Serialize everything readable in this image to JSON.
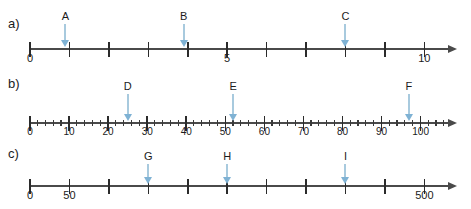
{
  "header": {
    "cut_text": ""
  },
  "lines": [
    {
      "id": "a",
      "label": "a)",
      "axis": {
        "min": 0,
        "max": 10.6,
        "tick_step": 1
      },
      "tick_labels": [
        {
          "value": 0,
          "text": "0"
        },
        {
          "value": 5,
          "text": "5"
        },
        {
          "value": 10,
          "text": "10"
        }
      ],
      "markers": [
        {
          "name": "A",
          "label": "A",
          "value": 0.9
        },
        {
          "name": "B",
          "label": "B",
          "value": 3.9
        },
        {
          "name": "C",
          "label": "C",
          "value": 8.0
        }
      ]
    },
    {
      "id": "b",
      "label": "b)",
      "axis": {
        "min": 0,
        "max": 107,
        "tick_step": 2,
        "minor_step": 2,
        "mid_step": 10,
        "major_step": 10
      },
      "tick_labels": [
        {
          "value": 0,
          "text": "0"
        },
        {
          "value": 10,
          "text": "10"
        },
        {
          "value": 20,
          "text": "20"
        },
        {
          "value": 30,
          "text": "30"
        },
        {
          "value": 40,
          "text": "40"
        },
        {
          "value": 50,
          "text": "50"
        },
        {
          "value": 60,
          "text": "60"
        },
        {
          "value": 70,
          "text": "70"
        },
        {
          "value": 80,
          "text": "80"
        },
        {
          "value": 90,
          "text": "90"
        },
        {
          "value": 100,
          "text": "100"
        }
      ],
      "markers": [
        {
          "name": "D",
          "label": "D",
          "value": 25
        },
        {
          "name": "E",
          "label": "E",
          "value": 52
        },
        {
          "name": "F",
          "label": "F",
          "value": 97
        }
      ]
    },
    {
      "id": "c",
      "label": "c)",
      "axis": {
        "min": 0,
        "max": 530,
        "tick_step": 50
      },
      "tick_labels": [
        {
          "value": 0,
          "text": "0"
        },
        {
          "value": 50,
          "text": "50"
        },
        {
          "value": 500,
          "text": "500"
        }
      ],
      "markers": [
        {
          "name": "G",
          "label": "G",
          "value": 150
        },
        {
          "name": "H",
          "label": "H",
          "value": 250
        },
        {
          "name": "I",
          "label": "I",
          "value": 400
        }
      ]
    }
  ],
  "colors": {
    "axis": "#4a4a4a",
    "tick": "#2b2b2b",
    "marker": "#7fb2d4",
    "marker_shaft": "#a8cade",
    "text": "#1b1b1b"
  }
}
